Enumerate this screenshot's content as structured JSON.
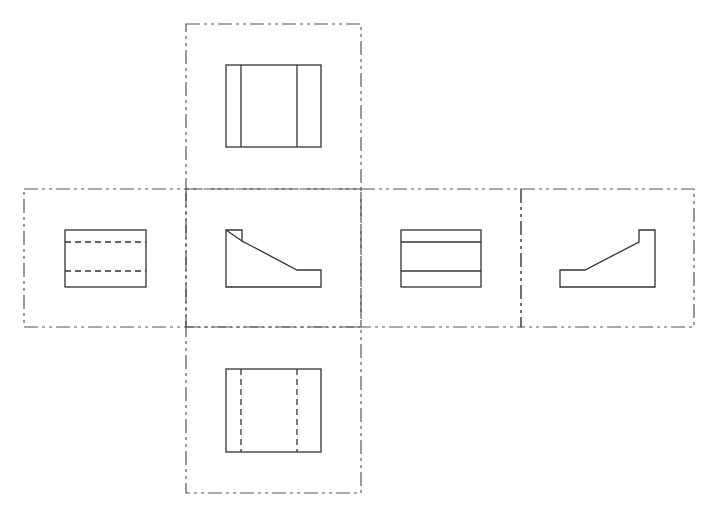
{
  "diagram": {
    "title": "",
    "type": "orthographic-projection-six-views",
    "stroke_color": "#333333",
    "frame_color": "#555555",
    "background": "#ffffff",
    "views": [
      {
        "id": "top",
        "name": "Top view",
        "frame": {
          "x": 186,
          "y": 24,
          "w": 175,
          "h": 165
        },
        "outline": {
          "x": 226,
          "y": 65,
          "w": 95,
          "h": 82
        },
        "visible_lines": [
          [
            241,
            65,
            241,
            147
          ],
          [
            297,
            65,
            297,
            147
          ]
        ],
        "hidden_lines": []
      },
      {
        "id": "left",
        "name": "Left side view",
        "frame": {
          "x": 24,
          "y": 189,
          "w": 162,
          "h": 138
        },
        "outline": {
          "x": 65,
          "y": 230,
          "w": 81,
          "h": 57
        },
        "visible_lines": [],
        "hidden_lines": [
          [
            65,
            242,
            146,
            242
          ],
          [
            65,
            271,
            146,
            271
          ]
        ]
      },
      {
        "id": "front",
        "name": "Front view",
        "frame": {
          "x": 186,
          "y": 189,
          "w": 175,
          "h": 138
        },
        "polygon": [
          [
            226,
            230
          ],
          [
            242,
            230
          ],
          [
            242,
            241
          ],
          [
            297,
            270
          ],
          [
            321,
            270
          ],
          [
            321,
            287
          ],
          [
            226,
            287
          ]
        ],
        "visible_lines": [
          [
            226,
            230,
            242,
            241
          ]
        ],
        "hidden_lines": []
      },
      {
        "id": "right",
        "name": "Right side view",
        "frame": {
          "x": 361,
          "y": 189,
          "w": 160,
          "h": 138
        },
        "outline": {
          "x": 401,
          "y": 230,
          "w": 80,
          "h": 57
        },
        "visible_lines": [
          [
            401,
            242,
            481,
            242
          ],
          [
            401,
            271,
            481,
            271
          ]
        ],
        "hidden_lines": []
      },
      {
        "id": "rear",
        "name": "Rear view",
        "frame": {
          "x": 521,
          "y": 189,
          "w": 173,
          "h": 138
        },
        "polygon": [
          [
            560,
            270
          ],
          [
            585,
            270
          ],
          [
            639,
            242
          ],
          [
            639,
            230
          ],
          [
            655,
            230
          ],
          [
            655,
            287
          ],
          [
            560,
            287
          ]
        ],
        "visible_lines": [],
        "hidden_lines": []
      },
      {
        "id": "bottom",
        "name": "Bottom view",
        "frame": {
          "x": 186,
          "y": 327,
          "w": 175,
          "h": 166
        },
        "outline": {
          "x": 226,
          "y": 369,
          "w": 95,
          "h": 83
        },
        "visible_lines": [],
        "hidden_lines": [
          [
            241,
            369,
            241,
            452
          ],
          [
            297,
            369,
            297,
            452
          ]
        ]
      }
    ]
  }
}
